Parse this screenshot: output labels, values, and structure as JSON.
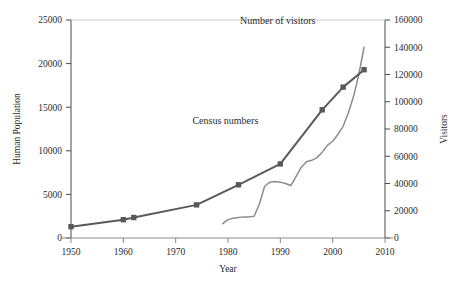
{
  "chart_data": {
    "type": "line",
    "title": "",
    "xlabel": "Year",
    "ylabel": "Human Population",
    "y2label": "Visitors",
    "xlim": [
      1950,
      2010
    ],
    "ylim": [
      0,
      25000
    ],
    "y2lim": [
      0,
      160000
    ],
    "grid": false,
    "legend_position": "inline-annotations",
    "xticks": [
      1950,
      1960,
      1970,
      1980,
      1990,
      2000,
      2010
    ],
    "yticks": [
      0,
      5000,
      10000,
      15000,
      20000,
      25000
    ],
    "y2ticks": [
      0,
      20000,
      40000,
      60000,
      80000,
      100000,
      120000,
      140000,
      160000
    ],
    "xtick_labels": [
      "1950",
      "1960",
      "1970",
      "1980",
      "1990",
      "2000",
      "2010"
    ],
    "ytick_labels": [
      "0",
      "5000",
      "10000",
      "15000",
      "20000",
      "25000"
    ],
    "y2tick_labels": [
      "0",
      "20000",
      "40000",
      "60000",
      "80000",
      "100000",
      "120000",
      "140000",
      "160000"
    ],
    "series": [
      {
        "name": "Census numbers",
        "axis": "left",
        "color": "#595959",
        "marker": "square",
        "label_text": "Census numbers",
        "label_x": 1979.5,
        "label_y": 13100,
        "x": [
          1950,
          1960,
          1962,
          1974,
          1982,
          1990,
          1998,
          2002,
          2006
        ],
        "y": [
          1300,
          2100,
          2350,
          3800,
          6100,
          8500,
          14700,
          17300,
          19300
        ]
      },
      {
        "name": "Number of visitors",
        "axis": "right",
        "color": "#8c8c8c",
        "marker": "none",
        "label_text": "Number of visitors",
        "label_x": 1989.5,
        "label_y": 24500,
        "x": [
          1979,
          1980,
          1981,
          1982,
          1983,
          1984,
          1985,
          1986,
          1987,
          1988,
          1989,
          1990,
          1991,
          1992,
          1993,
          1994,
          1995,
          1996,
          1997,
          1998,
          1999,
          2000,
          2001,
          2002,
          2003,
          2004,
          2005,
          2006
        ],
        "y": [
          10500,
          13500,
          14500,
          15000,
          15500,
          15500,
          16000,
          25000,
          38000,
          41000,
          41500,
          41000,
          40000,
          38500,
          45000,
          52000,
          56000,
          57000,
          59000,
          63000,
          68000,
          71000,
          76000,
          82000,
          92000,
          104000,
          120000,
          140000
        ]
      }
    ]
  },
  "axes": {
    "left_title": "Human Population",
    "right_title": "Visitors",
    "bottom_title": "Year"
  }
}
